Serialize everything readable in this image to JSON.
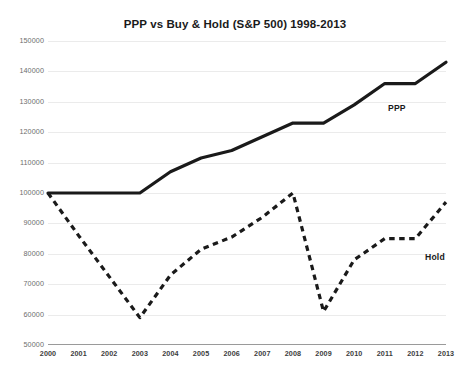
{
  "chart_data": {
    "type": "line",
    "title": "PPP vs Buy & Hold (S&P 500) 1998-2013",
    "xlabel": "",
    "ylabel": "",
    "categories": [
      "2000",
      "2001",
      "2002",
      "2003",
      "2004",
      "2005",
      "2006",
      "2007",
      "2008",
      "2009",
      "2010",
      "2011",
      "2012",
      "2013"
    ],
    "x": [
      2000,
      2001,
      2002,
      2003,
      2004,
      2005,
      2006,
      2007,
      2008,
      2009,
      2010,
      2011,
      2012,
      2013
    ],
    "ylim": [
      50000,
      150000
    ],
    "xlim": [
      2000,
      2013
    ],
    "yticks": [
      50000,
      60000,
      70000,
      80000,
      90000,
      100000,
      110000,
      120000,
      130000,
      140000,
      150000
    ],
    "ytick_labels": [
      "50000",
      "60000",
      "70000",
      "80000",
      "90000",
      "100000",
      "110000",
      "120000",
      "130000",
      "140000",
      "150000"
    ],
    "grid": true,
    "legend_position": "inline-annotation",
    "series": [
      {
        "name": "PPP",
        "style": "solid",
        "color": "#1a1a1a",
        "values": [
          100000,
          100000,
          100000,
          100000,
          107000,
          111500,
          114000,
          118500,
          123000,
          123000,
          129000,
          136000,
          136000,
          143000
        ]
      },
      {
        "name": "Hold",
        "style": "dashed",
        "color": "#1a1a1a",
        "values": [
          100000,
          86000,
          72500,
          59000,
          73000,
          81500,
          85500,
          92000,
          100000,
          61000,
          78000,
          85000,
          85000,
          97000
        ]
      }
    ],
    "annotations": [
      {
        "label": "PPP",
        "series": "PPP"
      },
      {
        "label": "Hold",
        "series": "Hold"
      }
    ]
  },
  "colors": {
    "background": "#ffffff",
    "line": "#1a1a1a",
    "gridline": "#ebebeb",
    "axis": "#9a9a9a",
    "ytick_text": "#6d6d6d",
    "xtick_text": "#3c3c3c",
    "title_text": "#1a1a1a"
  }
}
